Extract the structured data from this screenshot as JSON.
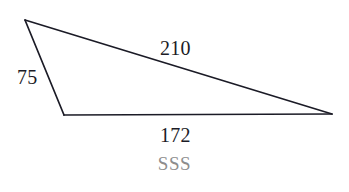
{
  "figure": {
    "type": "triangle-diagram",
    "background_color": "#ffffff",
    "stroke_color": "#1b1b26",
    "stroke_width": 1.6,
    "label_color": "#1b1b26",
    "caption_color": "#8d8d8d",
    "vertices": {
      "top_left": {
        "x": 25,
        "y": 20
      },
      "bottom_left": {
        "x": 64,
        "y": 115
      },
      "right": {
        "x": 332,
        "y": 114
      }
    },
    "sides": [
      {
        "name": "top-side",
        "label": "210",
        "from": "top_left",
        "to": "right"
      },
      {
        "name": "left-side",
        "label": "75",
        "from": "top_left",
        "to": "bottom_left"
      },
      {
        "name": "bottom-side",
        "label": "172",
        "from": "bottom_left",
        "to": "right"
      }
    ],
    "labels": {
      "top": "210",
      "left": "75",
      "bottom": "172"
    },
    "caption": "SSS"
  }
}
